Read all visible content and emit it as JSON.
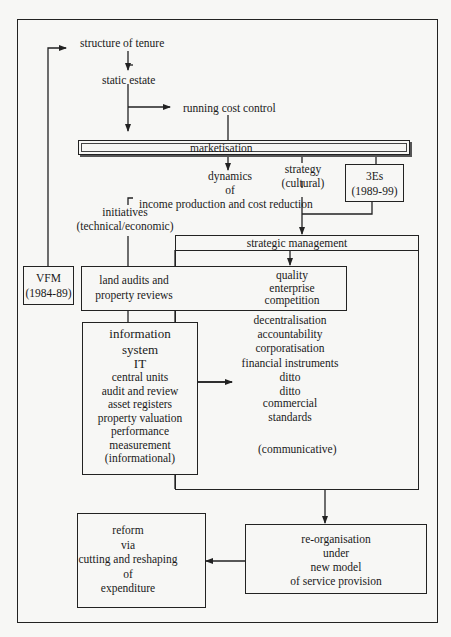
{
  "diagram": {
    "nodes": {
      "structure_of_tenure": "structure of tenure",
      "static_estate": "static estate",
      "running_cost_control": "running cost control",
      "marketisation": "marketisation",
      "dynamics": [
        "dynamics",
        "of"
      ],
      "income_production": "income production and cost reduction",
      "strategy": [
        "strategy",
        "(cultural)"
      ],
      "three_es": [
        "3Es",
        "(1989-99)"
      ],
      "initiatives": [
        "initiatives",
        "(technical/economic)"
      ],
      "strategic_management": "strategic management",
      "vfm": [
        "VFM",
        "(1984-89)"
      ],
      "land_audits": [
        "land audits and",
        "property reviews"
      ],
      "quality": [
        "quality",
        "enterprise",
        "competition"
      ],
      "information_system": [
        "information",
        "system",
        "IT",
        "central units",
        "audit and review",
        "asset registers",
        "property valuation",
        "performance",
        "measurement",
        "(informational)"
      ],
      "communicative_list": [
        "decentralisation",
        "accountability",
        "corporatisation",
        "financial instruments",
        "ditto",
        "ditto",
        "commercial",
        "standards"
      ],
      "communicative_label": "(communicative)",
      "reorganisation": [
        "re-organisation",
        "under",
        "new model",
        "of service provision"
      ],
      "reform": [
        "reform",
        "via",
        "cutting and reshaping",
        "of",
        "expenditure"
      ]
    },
    "colors": {
      "line": "#222222",
      "background": "#f7f7f5"
    }
  }
}
